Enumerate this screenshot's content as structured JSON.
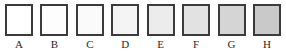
{
  "figure": {
    "type": "grayscale-swatch-scale",
    "orientation": "horizontal",
    "background_color": "#ffffff",
    "border_color": "#3b3b3b",
    "border_width_px": 2,
    "swatch_count": 8,
    "label_color": "#2a2a2a"
  },
  "chart_data": {
    "type": "bar",
    "title": "",
    "subtitle": "",
    "xlabel": "",
    "ylabel": "",
    "grid": false,
    "legend": null,
    "categories": [
      "A",
      "B",
      "C",
      "D",
      "E",
      "F",
      "G",
      "H"
    ],
    "values": [
      100,
      99,
      98,
      96,
      93,
      89,
      85,
      80
    ],
    "value_unit": "percent lightness",
    "ylim": [
      0,
      100
    ],
    "colors": [
      "#ffffff",
      "#fdfdfd",
      "#fafafa",
      "#f4f4f4",
      "#ececec",
      "#e2e2e2",
      "#d5d5d5",
      "#c9c9c9"
    ]
  },
  "swatches": [
    {
      "label": "A",
      "fill": "#ffffff"
    },
    {
      "label": "B",
      "fill": "#fdfdfd"
    },
    {
      "label": "C",
      "fill": "#fafafa"
    },
    {
      "label": "D",
      "fill": "#f4f4f4"
    },
    {
      "label": "E",
      "fill": "#ececec"
    },
    {
      "label": "F",
      "fill": "#e2e2e2"
    },
    {
      "label": "G",
      "fill": "#d5d5d5"
    },
    {
      "label": "H",
      "fill": "#c9c9c9"
    }
  ]
}
